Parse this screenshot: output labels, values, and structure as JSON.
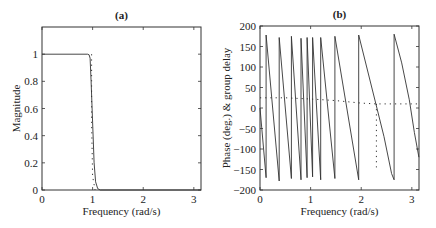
{
  "chart_data": [
    {
      "id": "a",
      "type": "line",
      "title": "(a)",
      "xlabel": "Frequency (rad/s)",
      "ylabel": "Magnitude",
      "xlim": [
        0,
        3.14159
      ],
      "ylim": [
        0,
        1.2
      ],
      "xticks": [
        0,
        1,
        2,
        3
      ],
      "yticks": [
        0,
        0.2,
        0.4,
        0.6,
        0.8,
        1
      ],
      "ytick_labels": [
        "0",
        "0.2",
        "0.4",
        "0.6",
        "0.8",
        "1"
      ],
      "grid": false,
      "series": [
        {
          "name": "magnitude",
          "style": "solid",
          "x": [
            0,
            0.9,
            0.93,
            0.95,
            0.97,
            1.0,
            1.03,
            1.06,
            1.1,
            1.15,
            3.14159
          ],
          "y": [
            1,
            1,
            0.995,
            0.97,
            0.8,
            0.5,
            0.2,
            0.06,
            0.01,
            0,
            0
          ]
        },
        {
          "name": "ideal-cutoff",
          "style": "dotted",
          "x": [
            0.98,
            0.98,
            1.0,
            1.05
          ],
          "y": [
            1,
            0.5,
            0.1,
            0
          ]
        }
      ]
    },
    {
      "id": "b",
      "type": "line",
      "title": "(b)",
      "xlabel": "Frequency (rad/s)",
      "ylabel": "Phase (deg.) & group delay",
      "xlim": [
        0,
        3.14159
      ],
      "ylim": [
        -200,
        200
      ],
      "xticks": [
        0,
        1,
        2,
        3
      ],
      "yticks": [
        -200,
        -150,
        -100,
        -50,
        0,
        50,
        100,
        150,
        200
      ],
      "ytick_labels": [
        "−200",
        "−150",
        "−100",
        "−50",
        "0",
        "50",
        "100",
        "150",
        "200"
      ],
      "grid": false,
      "series": [
        {
          "name": "phase",
          "style": "solid",
          "x": [
            0,
            0.12,
            0.12,
            0.38,
            0.38,
            0.62,
            0.62,
            0.81,
            0.81,
            0.93,
            0.93,
            1.04,
            1.04,
            1.2,
            1.2,
            1.48,
            1.48,
            1.95,
            1.95,
            2.3,
            2.45,
            2.6,
            2.65,
            2.65,
            2.8,
            2.95,
            3.05,
            3.14
          ],
          "y": [
            0,
            -170,
            178,
            -178,
            172,
            -172,
            175,
            -175,
            170,
            -170,
            172,
            -168,
            172,
            -175,
            172,
            -172,
            175,
            -175,
            178,
            5,
            -70,
            -160,
            -175,
            180,
            110,
            20,
            -60,
            -120
          ]
        },
        {
          "name": "group-delay",
          "style": "dotted",
          "x": [
            0,
            0.5,
            1.0,
            1.5,
            2.0,
            2.3,
            2.35,
            2.5,
            3.14
          ],
          "y": [
            25,
            25,
            22,
            18,
            12,
            10,
            10,
            10,
            10
          ]
        },
        {
          "name": "group-delay-drop",
          "style": "dotted",
          "x": [
            2.3,
            2.3
          ],
          "y": [
            10,
            -145
          ]
        }
      ]
    }
  ]
}
